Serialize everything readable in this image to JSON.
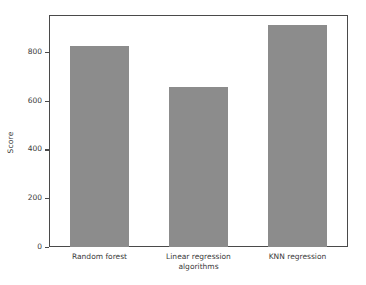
{
  "chart_data": {
    "type": "bar",
    "title": "",
    "subtitle": "",
    "xlabel": "",
    "ylabel": "Score",
    "categories": [
      "Random forest",
      "Linear regression\nalgorithms",
      "KNN regression"
    ],
    "values": [
      830,
      660,
      915
    ],
    "ylim": [
      0,
      952
    ],
    "yticks": [
      0,
      200,
      400,
      600,
      800
    ],
    "ytick_labels": [
      "0",
      "200",
      "400",
      "600",
      "800"
    ],
    "grid": false,
    "legend": null,
    "bar_color": "#8c8c8c",
    "frame_color": "#4a4a4a",
    "text_color": "#3a3a3a",
    "background": "#ffffff"
  }
}
